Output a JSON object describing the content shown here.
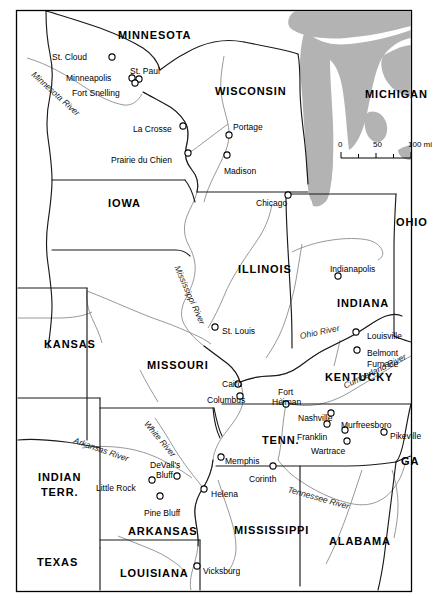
{
  "map": {
    "title": "Civil War Era Western Theater Map",
    "colors": {
      "land": "#ffffff",
      "water": "#b3b3b3",
      "state_border": "#1a1a1a",
      "river": "#8c8c8c",
      "frame": "#000000",
      "text": "#000000"
    },
    "frame": {
      "x": 16,
      "y": 10,
      "width": 396,
      "height": 582
    },
    "states": [
      {
        "name": "MINNESOTA",
        "x": 118,
        "y": 29,
        "size": 11
      },
      {
        "name": "WISCONSIN",
        "x": 215,
        "y": 85,
        "size": 11
      },
      {
        "name": "MICHIGAN",
        "x": 365,
        "y": 88,
        "size": 11
      },
      {
        "name": "IOWA",
        "x": 108,
        "y": 197,
        "size": 11
      },
      {
        "name": "ILLINOIS",
        "x": 238,
        "y": 263,
        "size": 11
      },
      {
        "name": "OHIO",
        "x": 396,
        "y": 216,
        "size": 11
      },
      {
        "name": "INDIANA",
        "x": 337,
        "y": 297,
        "size": 11
      },
      {
        "name": "KANSAS",
        "x": 44,
        "y": 338,
        "size": 11
      },
      {
        "name": "MISSOURI",
        "x": 147,
        "y": 359,
        "size": 11
      },
      {
        "name": "KENTUCKY",
        "x": 325,
        "y": 371,
        "size": 11
      },
      {
        "name": "TENN.",
        "x": 262,
        "y": 434,
        "size": 11
      },
      {
        "name": "INDIAN",
        "x": 38,
        "y": 471,
        "size": 11
      },
      {
        "name": "TERR.",
        "x": 41,
        "y": 486,
        "size": 11
      },
      {
        "name": "ARKANSAS",
        "x": 128,
        "y": 525,
        "size": 11
      },
      {
        "name": "MISSISSIPPI",
        "x": 234,
        "y": 524,
        "size": 11
      },
      {
        "name": "ALABAMA",
        "x": 329,
        "y": 535,
        "size": 11
      },
      {
        "name": "GA",
        "x": 401,
        "y": 455,
        "size": 11
      },
      {
        "name": "TEXAS",
        "x": 37,
        "y": 556,
        "size": 11
      },
      {
        "name": "LOUISIANA",
        "x": 120,
        "y": 567,
        "size": 11
      }
    ],
    "cities": [
      {
        "name": "St. Cloud",
        "lx": 52,
        "ly": 52,
        "mx": 112,
        "my": 57,
        "anchor": "right"
      },
      {
        "name": "Minneapolis",
        "lx": 66,
        "ly": 73,
        "mx": 132,
        "my": 78,
        "anchor": "right"
      },
      {
        "name": "St. Paul",
        "lx": 130,
        "ly": 66,
        "mx": 139,
        "my": 79,
        "anchor": "left"
      },
      {
        "name": "Fort Snelling",
        "lx": 72,
        "ly": 88,
        "mx": 135,
        "my": 83,
        "anchor": "right"
      },
      {
        "name": "La Crosse",
        "lx": 133,
        "ly": 124,
        "mx": 183,
        "my": 126,
        "anchor": "right"
      },
      {
        "name": "Prairie du Chien",
        "lx": 111,
        "ly": 155,
        "mx": 188,
        "my": 153,
        "anchor": "right"
      },
      {
        "name": "Portage",
        "lx": 233,
        "ly": 122,
        "mx": 229,
        "my": 135,
        "anchor": "left"
      },
      {
        "name": "Madison",
        "lx": 224,
        "ly": 166,
        "mx": 227,
        "my": 155,
        "anchor": "left"
      },
      {
        "name": "Chicago",
        "lx": 256,
        "ly": 198,
        "mx": 288,
        "my": 195,
        "anchor": "right"
      },
      {
        "name": "Indianapolis",
        "lx": 330,
        "ly": 264,
        "mx": 338,
        "my": 276,
        "anchor": "left"
      },
      {
        "name": "St. Louis",
        "lx": 222,
        "ly": 326,
        "mx": 215,
        "my": 327,
        "anchor": "left"
      },
      {
        "name": "Louisville",
        "lx": 367,
        "ly": 331,
        "mx": 356,
        "my": 332,
        "anchor": "left"
      },
      {
        "name": "Belmont",
        "lx": 367,
        "ly": 348,
        "mx": 357,
        "my": 350,
        "anchor": "left"
      },
      {
        "name": "Furnace",
        "lx": 367,
        "ly": 359,
        "mx": -1,
        "my": -1,
        "anchor": "left"
      },
      {
        "name": "Cairo",
        "lx": 222,
        "ly": 379,
        "mx": 238,
        "my": 384,
        "anchor": "right"
      },
      {
        "name": "Columbus",
        "lx": 207,
        "ly": 395,
        "mx": 240,
        "my": 396,
        "anchor": "right"
      },
      {
        "name": "Fort",
        "lx": 278,
        "ly": 387,
        "mx": 286,
        "my": 404,
        "anchor": "left"
      },
      {
        "name": "Heiman",
        "lx": 272,
        "ly": 397,
        "mx": -1,
        "my": -1,
        "anchor": "left"
      },
      {
        "name": "Nashville",
        "lx": 298,
        "ly": 413,
        "mx": 331,
        "my": 413,
        "anchor": "right"
      },
      {
        "name": "Murfreesboro",
        "lx": 341,
        "ly": 420,
        "mx": 345,
        "my": 430,
        "anchor": "left"
      },
      {
        "name": "Franklin",
        "lx": 297,
        "ly": 432,
        "mx": 327,
        "my": 424,
        "anchor": "right"
      },
      {
        "name": "Wartrace",
        "lx": 311,
        "ly": 446,
        "mx": 347,
        "my": 441,
        "anchor": "right"
      },
      {
        "name": "Pikeville",
        "lx": 390,
        "ly": 431,
        "mx": 384,
        "my": 432,
        "anchor": "left"
      },
      {
        "name": "Memphis",
        "lx": 225,
        "ly": 456,
        "mx": 221,
        "my": 457,
        "anchor": "left"
      },
      {
        "name": "Corinth",
        "lx": 249,
        "ly": 474,
        "mx": 273,
        "my": 466,
        "anchor": "right"
      },
      {
        "name": "DeVall's",
        "lx": 150,
        "ly": 460,
        "mx": 177,
        "my": 476,
        "anchor": "right"
      },
      {
        "name": "Bluff",
        "lx": 156,
        "ly": 470,
        "mx": -1,
        "my": -1,
        "anchor": "right"
      },
      {
        "name": "Helena",
        "lx": 211,
        "ly": 489,
        "mx": 204,
        "my": 489,
        "anchor": "left"
      },
      {
        "name": "Little Rock",
        "lx": 96,
        "ly": 483,
        "mx": 152,
        "my": 480,
        "anchor": "right"
      },
      {
        "name": "Pine Bluff",
        "lx": 144,
        "ly": 508,
        "mx": 160,
        "my": 496,
        "anchor": "right"
      },
      {
        "name": "Vicksburg",
        "lx": 203,
        "ly": 566,
        "mx": 197,
        "my": 566,
        "anchor": "left"
      }
    ],
    "rivers": [
      {
        "name": "Minnesota River",
        "x": 33,
        "y": 68,
        "rotate": 42
      },
      {
        "name": "Mississippi River",
        "x": 177,
        "y": 261,
        "rotate": 66
      },
      {
        "name": "Ohio River",
        "x": 300,
        "y": 331,
        "rotate": -12
      },
      {
        "name": "Cumberland River",
        "x": 344,
        "y": 381,
        "rotate": -26
      },
      {
        "name": "White River",
        "x": 146,
        "y": 417,
        "rotate": 50
      },
      {
        "name": "Arkansas River",
        "x": 74,
        "y": 435,
        "rotate": 19
      },
      {
        "name": "Tennessee River",
        "x": 288,
        "y": 484,
        "rotate": 16
      }
    ],
    "scale_bar": {
      "x": 341,
      "y": 140,
      "width": 70,
      "labels": [
        "0",
        "50",
        "100 mi"
      ],
      "unit": "mi"
    }
  }
}
